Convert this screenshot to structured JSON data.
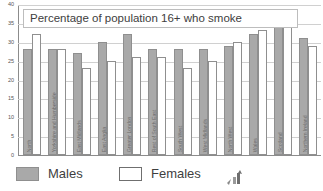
{
  "chart_data": {
    "type": "bar",
    "title": "Percentage of population 16+ who smoke",
    "xlabel": "",
    "ylabel": "",
    "ylim": [
      0,
      40
    ],
    "yticks": [
      "0",
      "5",
      "10",
      "15",
      "20",
      "25",
      "30",
      "35",
      "40"
    ],
    "grid": true,
    "legend_position": "bottom-left",
    "categories": [
      "North",
      "Yorkshire and Humberside",
      "East Midlands",
      "East Anglia",
      "Greater London",
      "Rest of South East",
      "South West",
      "West Midlands",
      "North West",
      "Wales",
      "Scotland",
      "Northern Ireland"
    ],
    "series": [
      {
        "name": "Males",
        "color": "#a9a9a9",
        "values": [
          28,
          28,
          27,
          30,
          32,
          28,
          28,
          28,
          29,
          32,
          34,
          31
        ]
      },
      {
        "name": "Females",
        "color": "#ffffff",
        "values": [
          32,
          28,
          23,
          25,
          26,
          26,
          23,
          25,
          30,
          33,
          34,
          29
        ]
      }
    ]
  },
  "legend": {
    "males_label": "Males",
    "females_label": "Females",
    "icon_name": "bar-chart-cursor-icon"
  }
}
